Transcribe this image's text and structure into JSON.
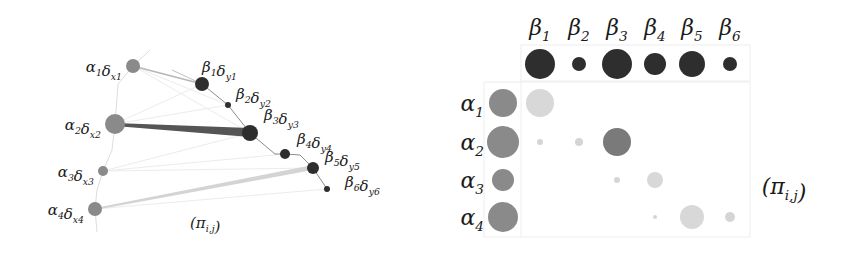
{
  "left_panel": {
    "caption": "(π",
    "caption_sub": "i,j",
    "caption_close": ")",
    "alpha_nodes": [
      {
        "greek": "α",
        "idx": "1",
        "delta": "δ",
        "var": "x",
        "var_idx": "1",
        "cx": 133,
        "cy": 66,
        "r": 7
      },
      {
        "greek": "α",
        "idx": "2",
        "delta": "δ",
        "var": "x",
        "var_idx": "2",
        "cx": 115,
        "cy": 124,
        "r": 10
      },
      {
        "greek": "α",
        "idx": "3",
        "delta": "δ",
        "var": "x",
        "var_idx": "3",
        "cx": 103,
        "cy": 171,
        "r": 5
      },
      {
        "greek": "α",
        "idx": "4",
        "delta": "δ",
        "var": "x",
        "var_idx": "4",
        "cx": 95,
        "cy": 209,
        "r": 7
      }
    ],
    "beta_nodes": [
      {
        "greek": "β",
        "idx": "1",
        "delta": "δ",
        "var": "y",
        "var_idx": "1",
        "cx": 202,
        "cy": 84,
        "r": 7
      },
      {
        "greek": "β",
        "idx": "2",
        "delta": "δ",
        "var": "y",
        "var_idx": "2",
        "cx": 228,
        "cy": 105,
        "r": 3
      },
      {
        "greek": "β",
        "idx": "3",
        "delta": "δ",
        "var": "y",
        "var_idx": "3",
        "cx": 250,
        "cy": 133,
        "r": 8
      },
      {
        "greek": "β",
        "idx": "4",
        "delta": "δ",
        "var": "y",
        "var_idx": "4",
        "cx": 285,
        "cy": 154,
        "r": 5
      },
      {
        "greek": "β",
        "idx": "5",
        "delta": "δ",
        "var": "y",
        "var_idx": "5",
        "cx": 313,
        "cy": 168,
        "r": 6
      },
      {
        "greek": "β",
        "idx": "6",
        "delta": "δ",
        "var": "y",
        "var_idx": "6",
        "cx": 327,
        "cy": 189,
        "r": 3
      }
    ],
    "colors": {
      "alpha": "#8a8a8a",
      "beta": "#2e2e2e",
      "strong_edge": "#555555",
      "light_edge": "#d0d0d0"
    }
  },
  "right_panel": {
    "caption": "(π",
    "caption_sub": "i,j",
    "caption_close": ")",
    "column_headers": [
      "β1",
      "β2",
      "β3",
      "β4",
      "β5",
      "β6"
    ],
    "row_headers": [
      "α1",
      "α2",
      "α3",
      "α4"
    ],
    "beta_weights_r": [
      15,
      7,
      15,
      11,
      13,
      7
    ],
    "alpha_weights_r": [
      14,
      16,
      11,
      15
    ],
    "coupling_r": [
      [
        14,
        0,
        0,
        0,
        0,
        0
      ],
      [
        3,
        4,
        14,
        0,
        0,
        0
      ],
      [
        0,
        0,
        3,
        8,
        0,
        0
      ],
      [
        0,
        0,
        0,
        2,
        12,
        5
      ]
    ],
    "coupling_shade": [
      [
        "#d8d8d8",
        "",
        "",
        "",
        "",
        ""
      ],
      [
        "#d5d5d5",
        "#d5d5d5",
        "#7a7a7a",
        "",
        "",
        ""
      ],
      [
        "",
        "",
        "#d5d5d5",
        "#d8d8d8",
        "",
        ""
      ],
      [
        "",
        "",
        "",
        "#d5d5d5",
        "#d8d8d8",
        "#d5d5d5"
      ]
    ]
  }
}
